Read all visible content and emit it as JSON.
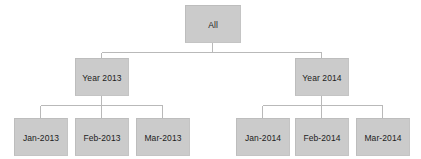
{
  "diagram": {
    "type": "hierarchy-tree",
    "title": "",
    "background_color": "#ffffff",
    "node_fill_color": "#cbcbcb",
    "node_border_color": "#bdbdbd",
    "connector_color": "#b9b9b9",
    "text_color": "#1c1c1c",
    "levels": 3,
    "root": {
      "id": "all",
      "label": "All",
      "children": [
        {
          "id": "year-2013",
          "label": "Year 2013",
          "children": [
            {
              "id": "jan-2013",
              "label": "Jan-2013"
            },
            {
              "id": "feb-2013",
              "label": "Feb-2013"
            },
            {
              "id": "mar-2013",
              "label": "Mar-2013"
            }
          ]
        },
        {
          "id": "year-2014",
          "label": "Year 2014",
          "children": [
            {
              "id": "jan-2014",
              "label": "Jan-2014"
            },
            {
              "id": "feb-2014",
              "label": "Feb-2014"
            },
            {
              "id": "mar-2014",
              "label": "Mar-2014"
            }
          ]
        }
      ]
    },
    "nodes": {
      "root": {
        "label": "All"
      },
      "year_2013": {
        "label": "Year 2013"
      },
      "year_2014": {
        "label": "Year 2014"
      },
      "jan_2013": {
        "label": "Jan-2013"
      },
      "feb_2013": {
        "label": "Feb-2013"
      },
      "mar_2013": {
        "label": "Mar-2013"
      },
      "jan_2014": {
        "label": "Jan-2014"
      },
      "feb_2014": {
        "label": "Feb-2014"
      },
      "mar_2014": {
        "label": "Mar-2014"
      }
    }
  }
}
